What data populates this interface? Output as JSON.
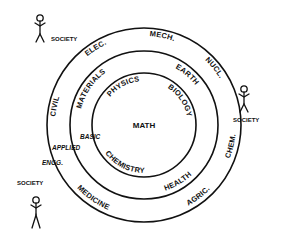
{
  "diagram": {
    "center": {
      "label": "MATH"
    },
    "inner_ring": {
      "name": "basic sciences",
      "labels": [
        "PHYSICS",
        "BIOLOGY",
        "CHEMISTRY"
      ]
    },
    "middle_ring": {
      "name": "applied sciences",
      "labels": [
        "MATERIALS",
        "EARTH",
        "HEALTH"
      ]
    },
    "outer_ring": {
      "name": "engineering",
      "labels": [
        "ELEC.",
        "MECH.",
        "NUCL.",
        "CHEM.",
        "AGRIC.",
        "MEDICINE",
        "CIVIL"
      ]
    },
    "level_labels": {
      "basic": "BASIC",
      "applied": "APPLIED",
      "engg": "ENGG."
    },
    "society": [
      {
        "label": "SOCIETY",
        "position": "top-left"
      },
      {
        "label": "SOCIETY",
        "position": "right"
      },
      {
        "label": "SOCIETY",
        "position": "bottom-left"
      }
    ],
    "colors": {
      "ink": "#111111",
      "background": "#ffffff"
    }
  }
}
